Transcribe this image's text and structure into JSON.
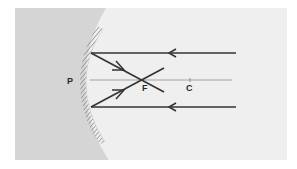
{
  "diagram": {
    "colors": {
      "outer_background": "#d4d4d4",
      "inner_region": "#efefef",
      "ray": "#333333",
      "axis": "#9a9a9a",
      "hatch": "#8a8a8a",
      "label": "#2a2a2a"
    },
    "labels": {
      "pole": "P",
      "focus": "F",
      "center": "C"
    },
    "elements": {
      "mirror": "concave-mirror",
      "principal_axis": "principal-axis",
      "incident_rays": 2,
      "reflected_rays": 2
    }
  }
}
